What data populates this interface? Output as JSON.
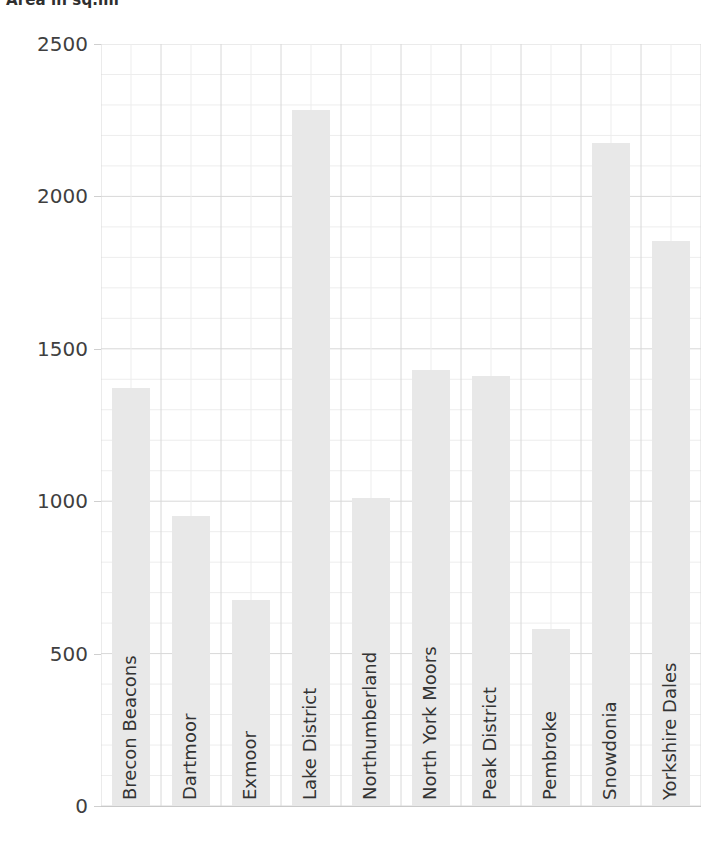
{
  "chart_data": {
    "type": "bar",
    "title": "Area in sq.mi",
    "xlabel": "",
    "ylabel": "",
    "ylim": [
      0,
      2500
    ],
    "grid": true,
    "legend": "none",
    "orientation": "vertical",
    "bar_color": "#e8e8e8",
    "categories": [
      "Brecon Beacons",
      "Dartmoor",
      "Exmoor",
      "Lake District",
      "Northumberland",
      "North York Moors",
      "Peak District",
      "Pembroke",
      "Snowdonia",
      "Yorkshire Dales"
    ],
    "values": [
      1370,
      950,
      675,
      2285,
      1010,
      1430,
      1410,
      580,
      2175,
      1855
    ],
    "y_ticks": [
      0,
      500,
      1000,
      1500,
      2000,
      2500
    ],
    "y_tick_labels": [
      "0",
      "500",
      "1000",
      "1500",
      "2000",
      "2500"
    ],
    "y_minor_tick_step": 100,
    "x_tick_labels_rotation": 90
  },
  "axis": {
    "y_labels": [
      "2500",
      "2000",
      "1500",
      "1000",
      "500",
      "0"
    ]
  },
  "colors": {
    "bar": "#e8e8e8",
    "gridline": "#d8d8d8",
    "minor_gridline": "#ededed",
    "axis_text": "#3f3f3f",
    "title_text": "#2f2f2f"
  }
}
